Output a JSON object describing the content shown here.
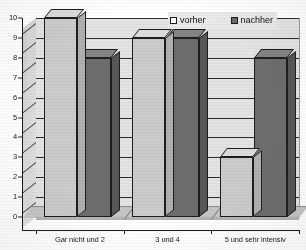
{
  "chart_data": {
    "type": "bar",
    "title": "",
    "subtitle": "",
    "xlabel": "",
    "ylabel": "",
    "categories": [
      "Gar nicht und 2",
      "3 und 4",
      "5 und sehr intensiv"
    ],
    "series": [
      {
        "name": "vorher",
        "values": [
          10,
          9,
          3
        ],
        "color": "#cbcbc9"
      },
      {
        "name": "nachher",
        "values": [
          8,
          9,
          8
        ],
        "color": "#6d6d6b"
      }
    ],
    "ylim": [
      0,
      10
    ],
    "ytick_labels": [
      "0",
      "1",
      "2",
      "3",
      "4",
      "5",
      "6",
      "7",
      "8",
      "9",
      "10"
    ],
    "ytick_values": [
      0,
      1,
      2,
      3,
      4,
      5,
      6,
      7,
      8,
      9,
      10
    ],
    "grid": true,
    "grid_axis": "y",
    "legend_position": "top-right",
    "style": "3d-grouped-bar",
    "colors": {
      "plot_background": "#e3e3e1",
      "floor": "#c6c6c4",
      "gridline": "#2b2b2b",
      "axis": "#1c1c1c",
      "text": "#1a1a1a",
      "series_vorher": "#cbcbc9",
      "series_nachher": "#6d6d6b",
      "legend_background": "#e9e9e7"
    }
  }
}
